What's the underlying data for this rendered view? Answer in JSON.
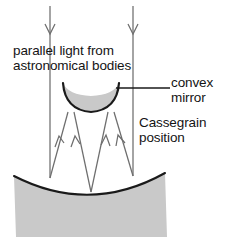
{
  "figure": {
    "kind": "optics-ray-diagram",
    "background_color": "#ffffff"
  },
  "labels": {
    "parallel_light": {
      "line1": "parallel light from",
      "line2": "astronomical bodies"
    },
    "convex_mirror": {
      "line1": "convex",
      "line2": "mirror"
    },
    "cassegrain": {
      "line1": "Cassegrain",
      "line2": "position"
    }
  },
  "colors": {
    "mirror_fill": "#c9c9c9",
    "mirror_edge": "#1a1a1a",
    "ray_stroke": "#6e6e6e",
    "text": "#141414",
    "leader_line": "#1a1a1a"
  },
  "elements": {
    "incoming_rays_label": "parallel downward light rays",
    "reflected_rays_label": "converging upward reflected rays",
    "secondary_mirror_label": "convex secondary mirror",
    "primary_mirror_label": "concave primary mirror",
    "leader_line_label": "convex mirror leader line"
  }
}
